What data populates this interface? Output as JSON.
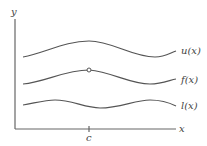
{
  "diagram": {
    "title": "",
    "axes": {
      "x_label": "x",
      "y_label": "y",
      "tick_label": "c"
    },
    "curves": [
      {
        "name": "upper",
        "label": "u(x)"
      },
      {
        "name": "middle",
        "label": "f(x)",
        "marker": "open circle at x = c"
      },
      {
        "name": "lower",
        "label": "l(x)"
      }
    ],
    "colors": {
      "curve": "#555555",
      "axis": "#666666",
      "background": "#ffffff"
    }
  }
}
